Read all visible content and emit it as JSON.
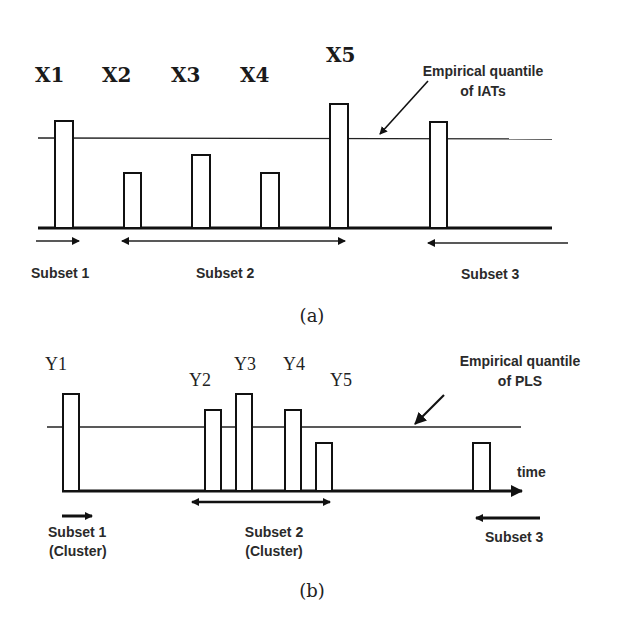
{
  "panel_a": {
    "caption": "(a)",
    "bar_labels": [
      "X1",
      "X2",
      "X3",
      "X4",
      "X5"
    ],
    "annotation_line1": "Empirical quantile",
    "annotation_line2": "of IATs",
    "subsets": [
      "Subset 1",
      "Subset 2",
      "Subset 3"
    ]
  },
  "panel_b": {
    "caption": "(b)",
    "bar_labels": [
      "Y1",
      "Y2",
      "Y3",
      "Y4",
      "Y5"
    ],
    "annotation_line1": "Empirical quantile",
    "annotation_line2": "of PLS",
    "axis_label": "time",
    "subsets": [
      {
        "line1": "Subset 1",
        "line2": "(Cluster)"
      },
      {
        "line1": "Subset 2",
        "line2": "(Cluster)"
      },
      {
        "line1": "Subset 3"
      }
    ]
  },
  "colors": {
    "stroke": "#111111",
    "background": "#ffffff"
  }
}
